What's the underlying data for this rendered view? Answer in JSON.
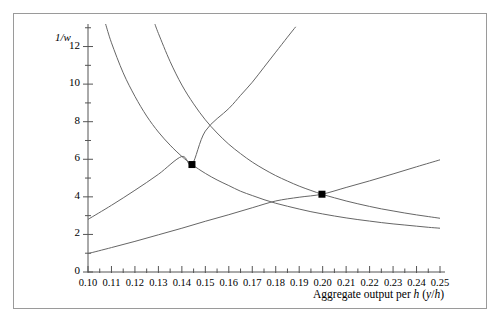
{
  "chart_data": {
    "type": "line",
    "title": "",
    "xlabel": "Aggregate output per h (y/h)",
    "ylabel": "1/w",
    "xlim": [
      0.1,
      0.25
    ],
    "ylim": [
      0,
      13.2
    ],
    "grid": false,
    "legend": false,
    "x_ticks": [
      "0.10",
      "0.11",
      "0.12",
      "0.13",
      "0.14",
      "0.15",
      "0.16",
      "0.17",
      "0.18",
      "0.19",
      "0.20",
      "0.21",
      "0.22",
      "0.23",
      "0.24",
      "0.25"
    ],
    "x_tick_values": [
      0.1,
      0.11,
      0.12,
      0.13,
      0.14,
      0.15,
      0.16,
      0.17,
      0.18,
      0.19,
      0.2,
      0.21,
      0.22,
      0.23,
      0.24,
      0.25
    ],
    "x_minor_step": 0.005,
    "y_ticks": [
      "0",
      "2",
      "4",
      "6",
      "8",
      "10",
      "12"
    ],
    "y_tick_values": [
      0,
      2,
      4,
      6,
      8,
      10,
      12
    ],
    "y_minor_step": 1,
    "series": [
      {
        "name": "price-setting-curve-1",
        "type": "curve",
        "points": [
          [
            0.1075,
            13.2
          ],
          [
            0.11,
            12.2
          ],
          [
            0.115,
            10.6
          ],
          [
            0.12,
            9.35
          ],
          [
            0.125,
            8.3
          ],
          [
            0.13,
            7.45
          ],
          [
            0.135,
            6.75
          ],
          [
            0.14,
            6.15
          ],
          [
            0.1443,
            5.72
          ],
          [
            0.15,
            5.25
          ],
          [
            0.155,
            4.9
          ],
          [
            0.16,
            4.6
          ],
          [
            0.165,
            4.3
          ],
          [
            0.17,
            4.07
          ],
          [
            0.175,
            3.85
          ],
          [
            0.18,
            3.66
          ],
          [
            0.185,
            3.5
          ],
          [
            0.19,
            3.35
          ],
          [
            0.195,
            3.21
          ],
          [
            0.2,
            3.09
          ],
          [
            0.205,
            2.98
          ],
          [
            0.21,
            2.88
          ],
          [
            0.215,
            2.79
          ],
          [
            0.22,
            2.71
          ],
          [
            0.225,
            2.63
          ],
          [
            0.23,
            2.56
          ],
          [
            0.235,
            2.5
          ],
          [
            0.24,
            2.44
          ],
          [
            0.245,
            2.38
          ],
          [
            0.25,
            2.33
          ]
        ]
      },
      {
        "name": "price-setting-curve-2",
        "type": "curve",
        "points": [
          [
            0.1285,
            13.2
          ],
          [
            0.13,
            12.7
          ],
          [
            0.135,
            11.2
          ],
          [
            0.14,
            9.95
          ],
          [
            0.145,
            8.95
          ],
          [
            0.15,
            8.1
          ],
          [
            0.155,
            7.4
          ],
          [
            0.16,
            6.8
          ],
          [
            0.165,
            6.3
          ],
          [
            0.17,
            5.85
          ],
          [
            0.175,
            5.47
          ],
          [
            0.18,
            5.13
          ],
          [
            0.185,
            4.84
          ],
          [
            0.19,
            4.57
          ],
          [
            0.195,
            4.34
          ],
          [
            0.1997,
            4.14
          ],
          [
            0.205,
            3.95
          ],
          [
            0.21,
            3.78
          ],
          [
            0.215,
            3.63
          ],
          [
            0.22,
            3.49
          ],
          [
            0.225,
            3.36
          ],
          [
            0.23,
            3.25
          ],
          [
            0.235,
            3.14
          ],
          [
            0.24,
            3.04
          ],
          [
            0.245,
            2.95
          ],
          [
            0.25,
            2.86
          ]
        ]
      },
      {
        "name": "wage-setting-curve-steep",
        "type": "curve",
        "points": [
          [
            0.1,
            2.8
          ],
          [
            0.11,
            3.55
          ],
          [
            0.12,
            4.35
          ],
          [
            0.13,
            5.2
          ],
          [
            0.1443,
            5.72
          ],
          [
            0.14,
            6.15
          ],
          [
            0.15,
            7.5
          ],
          [
            0.16,
            8.7
          ],
          [
            0.165,
            9.4
          ],
          [
            0.17,
            10.1
          ],
          [
            0.175,
            10.9
          ],
          [
            0.18,
            11.7
          ],
          [
            0.185,
            12.5
          ],
          [
            0.1885,
            13.05
          ]
        ]
      },
      {
        "name": "wage-setting-curve-flat",
        "type": "curve",
        "points": [
          [
            0.1,
            0.98
          ],
          [
            0.11,
            1.3
          ],
          [
            0.12,
            1.63
          ],
          [
            0.13,
            1.98
          ],
          [
            0.14,
            2.33
          ],
          [
            0.15,
            2.7
          ],
          [
            0.16,
            3.05
          ],
          [
            0.17,
            3.42
          ],
          [
            0.18,
            3.78
          ],
          [
            0.19,
            3.98
          ],
          [
            0.1997,
            4.14
          ],
          [
            0.21,
            4.5
          ],
          [
            0.22,
            4.85
          ],
          [
            0.23,
            5.22
          ],
          [
            0.24,
            5.6
          ],
          [
            0.25,
            5.97
          ]
        ]
      }
    ],
    "markers": [
      {
        "name": "equilibrium-point-1",
        "x": 0.1443,
        "y": 5.72,
        "style": "filled-square"
      },
      {
        "name": "equilibrium-point-2",
        "x": 0.1997,
        "y": 4.14,
        "style": "filled-square"
      }
    ]
  },
  "axis": {
    "y_label": "1/w",
    "x_label_prefix": "Aggregate output per ",
    "x_label_h": "h",
    "x_label_paren_open": " (",
    "x_label_y": "y",
    "x_label_slash": "/",
    "x_label_h2": "h",
    "x_label_paren_close": ")"
  },
  "colors": {
    "frame": "#9a9a9a",
    "axis": "#555555",
    "curve": "#666666",
    "marker": "#000000",
    "background": "#ffffff"
  }
}
